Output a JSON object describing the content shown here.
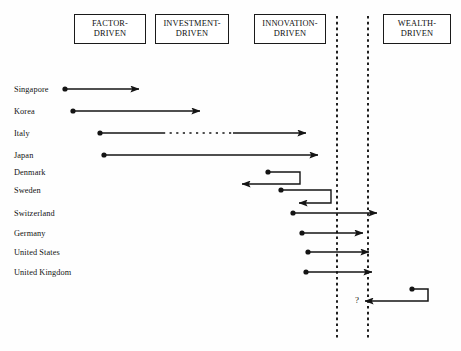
{
  "diagram": {
    "stages": [
      {
        "name": "factor-driven",
        "label_line1": "FACTOR-",
        "label_line2": "DRIVEN",
        "x": 74,
        "y": 14,
        "w": 72,
        "h": 30
      },
      {
        "name": "investment-driven",
        "label_line1": "INVESTMENT-",
        "label_line2": "DRIVEN",
        "x": 155,
        "y": 14,
        "w": 74,
        "h": 30
      },
      {
        "name": "innovation-driven",
        "label_line1": "INNOVATION-",
        "label_line2": "DRIVEN",
        "x": 254,
        "y": 14,
        "w": 72,
        "h": 30
      },
      {
        "name": "wealth-driven",
        "label_line1": "WEALTH-",
        "label_line2": "DRIVEN",
        "x": 383,
        "y": 14,
        "w": 68,
        "h": 30
      }
    ],
    "divider_lines": [
      {
        "name": "divider-left",
        "x": 337,
        "y1": 16,
        "y2": 340
      },
      {
        "name": "divider-right",
        "x": 368,
        "y1": 16,
        "y2": 340
      }
    ],
    "question_marker": {
      "label": "?",
      "x": 357,
      "y": 300
    },
    "countries": [
      {
        "label": "Singapore",
        "y": 89,
        "kind": "forward",
        "start": 65,
        "end": 139
      },
      {
        "label": "Korea",
        "y": 111,
        "kind": "forward",
        "start": 73,
        "end": 200
      },
      {
        "label": "Italy",
        "y": 133,
        "kind": "forward-dashed-mid",
        "start": 100,
        "end": 306,
        "dash_start": 163,
        "dash_end": 233
      },
      {
        "label": "Japan",
        "y": 155,
        "kind": "forward",
        "start": 104,
        "end": 318
      },
      {
        "label": "Denmark",
        "y": 172,
        "kind": "hook-back",
        "dot": 268,
        "turn": 300,
        "drop": 12,
        "end": 242
      },
      {
        "label": "Sweden",
        "y": 190,
        "kind": "hook-back",
        "dot": 281,
        "turn": 331,
        "drop": 13,
        "end": 299
      },
      {
        "label": "Switzerland",
        "y": 213,
        "kind": "forward",
        "start": 293,
        "end": 377
      },
      {
        "label": "Germany",
        "y": 233,
        "kind": "forward",
        "start": 302,
        "end": 363
      },
      {
        "label": "United States",
        "y": 252,
        "kind": "forward",
        "start": 308,
        "end": 369
      },
      {
        "label": "United Kingdom",
        "y": 272,
        "kind": "forward",
        "start": 306,
        "end": 372
      }
    ],
    "wealth_regression": {
      "name": "wealth-regression-arrow",
      "dot": 412,
      "turn": 428,
      "y": 289,
      "drop": 12,
      "end": 365
    },
    "label_x": 14,
    "colors": {
      "ink": "#141414",
      "box_border": "#1a1a1a",
      "paper": "#ffffff"
    }
  }
}
